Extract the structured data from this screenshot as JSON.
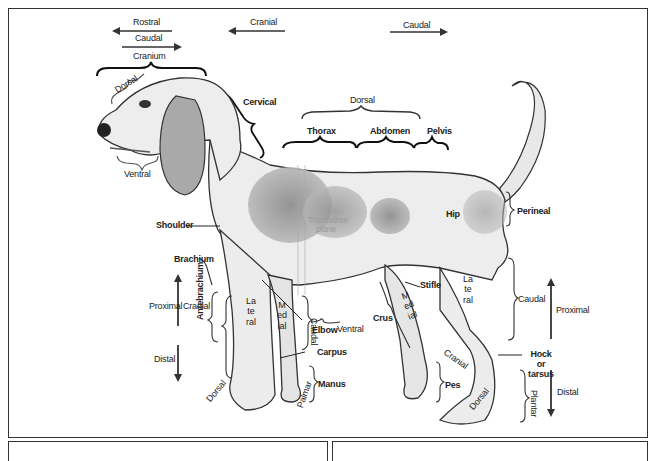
{
  "diagram": {
    "orientation_arrows": [
      {
        "label": "Rostral",
        "direction": "left"
      },
      {
        "label": "Caudal",
        "direction": "right",
        "context": "head"
      },
      {
        "label": "Cranial",
        "direction": "left"
      },
      {
        "label": "Caudal",
        "direction": "right",
        "context": "body"
      },
      {
        "label": "Proximal",
        "direction": "up",
        "context": "forelimb"
      },
      {
        "label": "Distal",
        "direction": "down",
        "context": "forelimb"
      },
      {
        "label": "Proximal",
        "direction": "up",
        "context": "hindlimb"
      },
      {
        "label": "Distal",
        "direction": "down",
        "context": "hindlimb"
      }
    ],
    "labels": {
      "rostral": "Rostral",
      "caudal_head": "Caudal",
      "cranium": "Cranium",
      "cranial_top": "Cranial",
      "caudal_top": "Caudal",
      "dorsal_head": "Dorsal",
      "ventral_head": "Ventral",
      "cervical": "Cervical",
      "dorsal_back": "Dorsal",
      "thorax": "Thorax",
      "abdomen": "Abdomen",
      "pelvis": "Pelvis",
      "shoulder": "Shoulder",
      "transverse_plane": "Transverse plane",
      "hip": "Hip",
      "perineal": "Perineal",
      "brachium": "Brachium",
      "proximal_fore": "Proximal",
      "distal_fore": "Distal",
      "cranial_fore": "Cranial",
      "antebrachium": "Antebrachium",
      "lateral_fore": "Lateral",
      "medial_fore": "Medial",
      "elbow": "Elbow",
      "ventral_body": "Ventral",
      "caudal_fore": "Caudal",
      "carpus": "Carpus",
      "manus": "Manus",
      "palmar": "Palmar",
      "dorsal_fore": "Dorsal",
      "stifle": "Stifle",
      "crus": "Crus",
      "medial_hind": "Medial",
      "lateral_hind": "Lateral",
      "cranial_hind": "Cranial",
      "caudal_hind": "Caudal",
      "hock": "Hock or tarsus",
      "pes": "Pes",
      "dorsal_hind": "Dorsal",
      "plantar": "Plantar",
      "proximal_hind": "Proximal",
      "distal_hind": "Distal"
    },
    "colors": {
      "ink": "#222222",
      "frame": "#333333",
      "coat_light": "#ececec",
      "coat_patch": "#9e9e9e",
      "plane_text": "#9a9a9a"
    }
  }
}
